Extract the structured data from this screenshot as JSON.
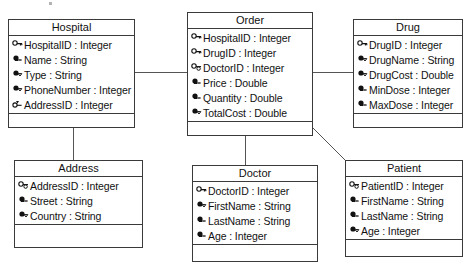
{
  "diagram": {
    "type": "uml-class-diagram",
    "classes": [
      {
        "id": "hospital",
        "name": "Hospital",
        "attributes": [
          {
            "icon": "key-icon",
            "name": "HospitalID",
            "type": "Integer",
            "text": "HospitalID : Integer"
          },
          {
            "icon": "lock-icon",
            "name": "Name",
            "type": "String",
            "text": "Name : String"
          },
          {
            "icon": "lock-icon",
            "name": "Type",
            "type": "String",
            "text": "Type : String"
          },
          {
            "icon": "lock-icon",
            "name": "PhoneNumber",
            "type": "Integer",
            "text": "PhoneNumber : Integer"
          },
          {
            "icon": "key-icon",
            "name": "AddressID",
            "type": "Integer",
            "text": "AddressID : Integer"
          }
        ],
        "methods": []
      },
      {
        "id": "order",
        "name": "Order",
        "attributes": [
          {
            "icon": "key-icon",
            "name": "HospitalID",
            "type": "Integer",
            "text": "HospitalID : Integer"
          },
          {
            "icon": "key-icon",
            "name": "DrugID",
            "type": "Integer",
            "text": "DrugID : Integer"
          },
          {
            "icon": "key-icon",
            "name": "DoctorID",
            "type": "Integer",
            "text": "DoctorID : Integer"
          },
          {
            "icon": "lock-icon",
            "name": "Price",
            "type": "Double",
            "text": "Price : Double"
          },
          {
            "icon": "lock-icon",
            "name": "Quantity",
            "type": "Double",
            "text": "Quantity : Double"
          },
          {
            "icon": "lock-icon",
            "name": "TotalCost",
            "type": "Double",
            "text": "TotalCost : Double"
          }
        ],
        "methods": []
      },
      {
        "id": "drug",
        "name": "Drug",
        "attributes": [
          {
            "icon": "key-icon",
            "name": "DrugID",
            "type": "Integer",
            "text": "DrugID : Integer"
          },
          {
            "icon": "lock-icon",
            "name": "DrugName",
            "type": "String",
            "text": "DrugName : String"
          },
          {
            "icon": "lock-icon",
            "name": "DrugCost",
            "type": "Double",
            "text": "DrugCost : Double"
          },
          {
            "icon": "lock-icon",
            "name": "MinDose",
            "type": "Integer",
            "text": "MinDose : Integer"
          },
          {
            "icon": "lock-icon",
            "name": "MaxDose",
            "type": "Integer",
            "text": "MaxDose : Integer"
          }
        ],
        "methods": []
      },
      {
        "id": "address",
        "name": "Address",
        "attributes": [
          {
            "icon": "key-icon",
            "name": "AddressID",
            "type": "Integer",
            "text": "AddressID : Integer"
          },
          {
            "icon": "lock-icon",
            "name": "Street",
            "type": "String",
            "text": "Street : String"
          },
          {
            "icon": "lock-icon",
            "name": "Country",
            "type": "String",
            "text": "Country : String"
          }
        ],
        "methods": []
      },
      {
        "id": "doctor",
        "name": "Doctor",
        "attributes": [
          {
            "icon": "key-icon",
            "name": "DoctorID",
            "type": "Integer",
            "text": "DoctorID : Integer"
          },
          {
            "icon": "lock-icon",
            "name": "FirstName",
            "type": "String",
            "text": "FirstName : String"
          },
          {
            "icon": "lock-icon",
            "name": "LastName",
            "type": "String",
            "text": "LastName : String"
          },
          {
            "icon": "lock-icon",
            "name": "Age",
            "type": "Integer",
            "text": "Age : Integer"
          }
        ],
        "methods": []
      },
      {
        "id": "patient",
        "name": "Patient",
        "attributes": [
          {
            "icon": "key-icon",
            "name": "PatientID",
            "type": "Integer",
            "text": "PatientID : Integer"
          },
          {
            "icon": "lock-icon",
            "name": "FirstName",
            "type": "String",
            "text": "FirstName : String"
          },
          {
            "icon": "lock-icon",
            "name": "LastName",
            "type": "String",
            "text": "LastName : String"
          },
          {
            "icon": "lock-icon",
            "name": "Age",
            "type": "Integer",
            "text": "Age : Integer"
          }
        ],
        "methods": []
      }
    ],
    "associations": [
      {
        "id": "hospital-order",
        "from": "hospital",
        "to": "order",
        "style": "horizontal"
      },
      {
        "id": "order-drug",
        "from": "order",
        "to": "drug",
        "style": "horizontal"
      },
      {
        "id": "hospital-address",
        "from": "hospital",
        "to": "address",
        "style": "vertical"
      },
      {
        "id": "order-doctor",
        "from": "order",
        "to": "doctor",
        "style": "vertical"
      },
      {
        "id": "order-patient",
        "from": "order",
        "to": "patient",
        "style": "diagonal"
      }
    ],
    "colors": {
      "border": "#3a3a3a",
      "line": "#555555",
      "background": "#ffffff",
      "text": "#111111"
    }
  }
}
